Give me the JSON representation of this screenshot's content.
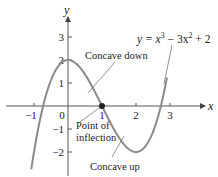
{
  "chart_data": {
    "type": "line",
    "title": "",
    "equation": {
      "prefix": "y = x",
      "exp1": "3",
      "middle": " − 3x",
      "exp2": "2",
      "suffix": " + 2"
    },
    "xlabel": "x",
    "ylabel": "y",
    "xlim": [
      -1.1,
      3.1
    ],
    "ylim": [
      -2.9,
      3.6
    ],
    "x_ticks": [
      {
        "value": -1,
        "label": "−1"
      },
      {
        "value": 0,
        "label": "0"
      },
      {
        "value": 1,
        "label": "1"
      },
      {
        "value": 2,
        "label": "2"
      },
      {
        "value": 3,
        "label": "3"
      }
    ],
    "y_ticks": [
      {
        "value": 3,
        "label": "3"
      },
      {
        "value": 2,
        "label": "2"
      },
      {
        "value": 1,
        "label": "1"
      },
      {
        "value": -1,
        "label": "−1"
      },
      {
        "value": -2,
        "label": "−2"
      }
    ],
    "grid": false,
    "series": [
      {
        "name": "y = x^3 - 3x^2 + 2",
        "function": "x^3 - 3x^2 + 2",
        "x_range": [
          -1.08,
          2.91
        ],
        "color": "#8a8a8a",
        "points": [
          {
            "x": -1.0,
            "y": -2.0
          },
          {
            "x": -0.5,
            "y": 1.125
          },
          {
            "x": 0.0,
            "y": 2.0
          },
          {
            "x": 0.5,
            "y": 1.375
          },
          {
            "x": 1.0,
            "y": 0.0
          },
          {
            "x": 1.5,
            "y": -1.375
          },
          {
            "x": 2.0,
            "y": -2.0
          },
          {
            "x": 2.5,
            "y": -1.125
          },
          {
            "x": 2.9,
            "y": 1.159
          }
        ]
      }
    ],
    "highlighted_point": {
      "x": 1,
      "y": 0,
      "label": "Point of inflection"
    },
    "annotations": [
      {
        "text": "Concave down",
        "target": {
          "x": 0.55,
          "y": 1.2
        }
      },
      {
        "text": "Point of",
        "text2": "inflection",
        "target": {
          "x": 1,
          "y": 0
        }
      },
      {
        "text": "Concave up",
        "target": {
          "x": 1.45,
          "y": -1.3
        }
      }
    ],
    "colors": {
      "curve": "#8a8a8a",
      "axes": "#555555",
      "point": "#222222",
      "leader_lines": "#777777"
    }
  },
  "labels": {
    "concave_down": "Concave down",
    "point_of": "Point of",
    "inflection": "inflection",
    "concave_up": "Concave up",
    "x_axis": "x",
    "y_axis": "y"
  }
}
